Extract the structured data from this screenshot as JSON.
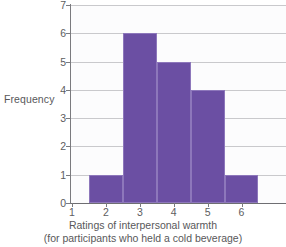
{
  "chart_data": {
    "type": "bar",
    "title": "",
    "subtitle": "",
    "xlabel": "Ratings of interpersonal warmth",
    "xlabel_line2": "(for participants who held a cold beverage)",
    "ylabel": "Frequency",
    "categories": [
      "1",
      "2",
      "3",
      "4",
      "5",
      "6"
    ],
    "values": [
      0,
      1,
      6,
      5,
      4,
      1
    ],
    "xlim": [
      1,
      6
    ],
    "ylim": [
      0,
      7
    ],
    "x_ticks": [
      "1",
      "2",
      "3",
      "4",
      "5",
      "6"
    ],
    "y_ticks": [
      "0",
      "1",
      "2",
      "3",
      "4",
      "5",
      "6",
      "7"
    ],
    "grid": "horizontal",
    "legend": "none",
    "bar_color": "#6b4fa3",
    "bar_edge_color": "#8d77bb",
    "gridline_color": "#c9c9cc",
    "axis_color": "#7a7a7e",
    "text_color": "#58585a",
    "background_color": "#ffffff",
    "plot_background_color": "#fcfcfd"
  }
}
